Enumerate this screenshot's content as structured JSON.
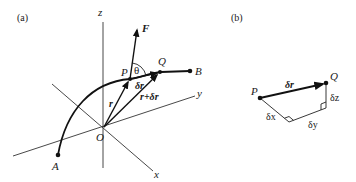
{
  "figure": {
    "panel_a": {
      "tag": "(a)",
      "axes": {
        "x": "x",
        "y": "y",
        "z": "z"
      },
      "points": {
        "origin": "O",
        "start": "A",
        "end": "B",
        "P": "P",
        "Q": "Q"
      },
      "vectors": {
        "force": "F",
        "position": "r",
        "displacement": "δr",
        "position_plus_displacement": "r+δr"
      },
      "angle": "θ"
    },
    "panel_b": {
      "tag": "(b)",
      "points": {
        "P": "P",
        "Q": "Q"
      },
      "vector": "δr",
      "components": {
        "dx": "δx",
        "dy": "δy",
        "dz": "δz"
      }
    }
  }
}
